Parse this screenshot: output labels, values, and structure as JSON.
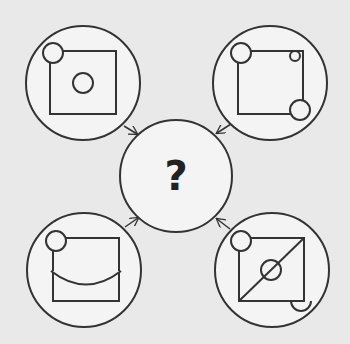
{
  "puzzle": {
    "center_label": "?",
    "colors": {
      "background": "#e9e9e9",
      "circle_fill": "#f4f4f4",
      "stroke": "#333333",
      "question_mark": "#222222"
    },
    "panels": [
      {
        "position": "top-left",
        "description": "square with circle at top-left corner and small circle in center"
      },
      {
        "position": "top-right",
        "description": "square with circle at top-left corner, small circle inside top-right corner, circle at bottom-right corner"
      },
      {
        "position": "bottom-left",
        "description": "square with circle at top-left corner and curved arc across middle"
      },
      {
        "position": "bottom-right",
        "description": "square with diagonal line, circle at top-left corner, circle on diagonal, half circle below bottom-right corner"
      }
    ]
  }
}
